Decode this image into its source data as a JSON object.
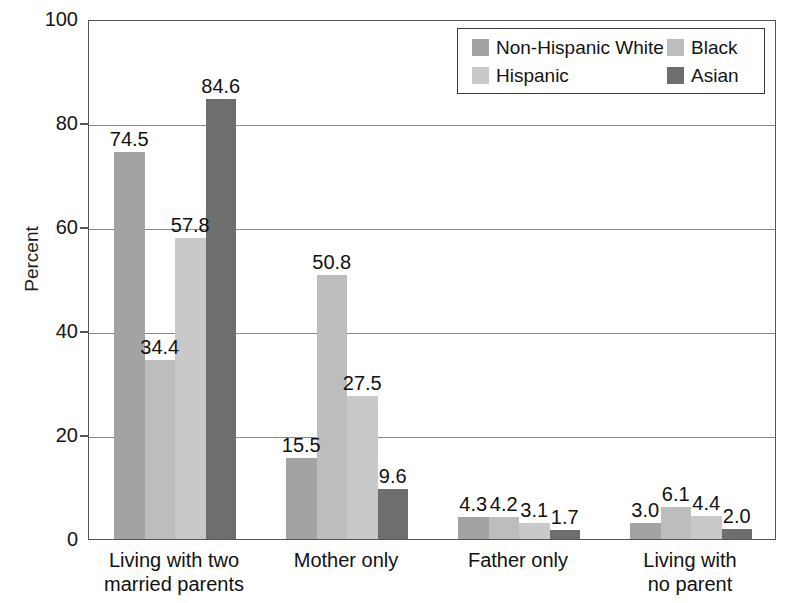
{
  "chart_data": {
    "type": "bar",
    "title": "",
    "subtitle": "",
    "xlabel": "",
    "ylabel": "Percent",
    "ylim": [
      0,
      100
    ],
    "yticks": [
      0,
      20,
      40,
      60,
      80,
      100
    ],
    "ytick_labels": [
      "0",
      "20",
      "40",
      "60",
      "80",
      "100"
    ],
    "grid": true,
    "grid_axis": "y",
    "legend_position": "top-right",
    "data_labels": true,
    "categories": [
      "Living with two\nmarried parents",
      "Mother only",
      "Father only",
      "Living with\nno parent"
    ],
    "series": [
      {
        "name": "Non-Hispanic White",
        "color": "#a3a3a3",
        "values": [
          74.5,
          15.5,
          4.3,
          3.0
        ],
        "labels": [
          "74.5",
          "15.5",
          "4.3",
          "3.0"
        ]
      },
      {
        "name": "Black",
        "color": "#bdbdbd",
        "values": [
          34.4,
          50.8,
          4.2,
          6.1
        ],
        "labels": [
          "34.4",
          "50.8",
          "4.2",
          "6.1"
        ]
      },
      {
        "name": "Hispanic",
        "color": "#c9c9c9",
        "values": [
          57.8,
          27.5,
          3.1,
          4.4
        ],
        "labels": [
          "57.8",
          "27.5",
          "3.1",
          "4.4"
        ]
      },
      {
        "name": "Asian",
        "color": "#6e6e6e",
        "values": [
          84.6,
          9.6,
          1.7,
          2.0
        ],
        "labels": [
          "84.6",
          "9.6",
          "1.7",
          "2.0"
        ]
      }
    ]
  },
  "axis": {
    "y_title": "Percent",
    "y_tick_labels": [
      "100",
      "80",
      "60",
      "40",
      "20",
      "0"
    ],
    "x_tick_labels": [
      "Living with two\nmarried parents",
      "Mother only",
      "Father only",
      "Living with\nno parent"
    ]
  },
  "legend": {
    "entries": [
      {
        "label": "Non-Hispanic White",
        "color": "#a3a3a3"
      },
      {
        "label": "Black",
        "color": "#bdbdbd"
      },
      {
        "label": "Hispanic",
        "color": "#c9c9c9"
      },
      {
        "label": "Asian",
        "color": "#6e6e6e"
      }
    ]
  },
  "style": {
    "plot_border_color": "#555555",
    "gridline_color": "#8a8a8a",
    "background": "#ffffff",
    "text_color": "#111111"
  }
}
